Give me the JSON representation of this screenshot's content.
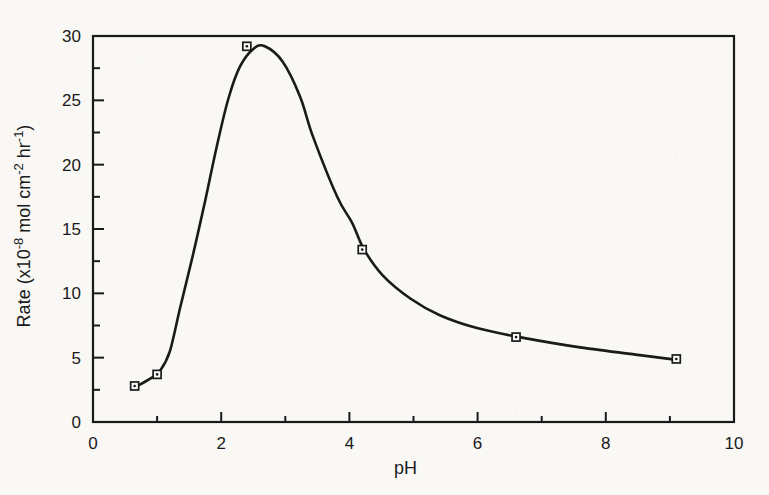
{
  "figure": {
    "paper_color": "#f9f8f5",
    "ink_color": "#1a1a1a",
    "marker_fill": "#fbfaf8"
  },
  "chart_data": {
    "type": "scatter",
    "title": "",
    "xlabel": "pH",
    "ylabel": "Rate (x10-8 mol cm-2 hr-1)",
    "ylabel_parts": [
      {
        "text": "Rate (x10",
        "sup": false
      },
      {
        "text": "-8",
        "sup": true
      },
      {
        "text": " mol cm",
        "sup": false
      },
      {
        "text": "-2",
        "sup": true
      },
      {
        "text": " hr",
        "sup": false
      },
      {
        "text": "-1",
        "sup": true
      },
      {
        "text": ")",
        "sup": false
      }
    ],
    "xlim": [
      0,
      10
    ],
    "ylim": [
      0,
      30
    ],
    "x_major_ticks": [
      0,
      2,
      4,
      6,
      8,
      10
    ],
    "x_minor_ticks": [
      1,
      3,
      5,
      7,
      9
    ],
    "y_major_ticks": [
      0,
      5,
      10,
      15,
      20,
      25,
      30
    ],
    "y_minor_ticks": [
      2.5,
      7.5,
      12.5,
      17.5,
      22.5,
      27.5
    ],
    "grid": false,
    "legend": null,
    "frame": "full-box",
    "marker": "open-square-center-dot",
    "points": [
      [
        0.65,
        2.8
      ],
      [
        1.0,
        3.7
      ],
      [
        2.4,
        29.2
      ],
      [
        4.2,
        13.4
      ],
      [
        6.6,
        6.6
      ],
      [
        9.1,
        4.9
      ]
    ],
    "fit_curve": [
      [
        0.62,
        2.6
      ],
      [
        0.9,
        3.4
      ],
      [
        1.05,
        4.0
      ],
      [
        1.2,
        5.5
      ],
      [
        1.36,
        8.9
      ],
      [
        1.56,
        13.0
      ],
      [
        1.75,
        17.2
      ],
      [
        1.93,
        21.4
      ],
      [
        2.11,
        25.1
      ],
      [
        2.29,
        27.6
      ],
      [
        2.5,
        29.0
      ],
      [
        2.68,
        29.2
      ],
      [
        2.96,
        28.0
      ],
      [
        3.23,
        25.3
      ],
      [
        3.43,
        22.2
      ],
      [
        3.81,
        17.5
      ],
      [
        4.04,
        15.5
      ],
      [
        4.23,
        13.4
      ],
      [
        4.52,
        11.4
      ],
      [
        4.95,
        9.6
      ],
      [
        5.41,
        8.3
      ],
      [
        5.99,
        7.3
      ],
      [
        6.65,
        6.6
      ],
      [
        7.6,
        5.8
      ],
      [
        8.53,
        5.2
      ],
      [
        9.08,
        4.85
      ]
    ]
  }
}
